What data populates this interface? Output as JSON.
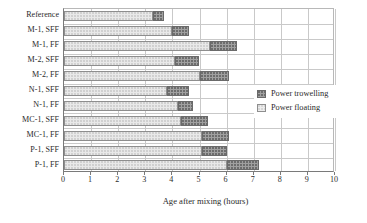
{
  "chart_data": {
    "type": "bar",
    "orientation": "horizontal",
    "stacked": true,
    "title": "",
    "xlabel": "Age after mixing (hours)",
    "ylabel": "",
    "xlim": [
      0,
      10
    ],
    "xticks": [
      "0",
      "1",
      "2",
      "3",
      "4",
      "5",
      "6",
      "7",
      "8",
      "9",
      "10"
    ],
    "grid": "vertical-and-horizontal",
    "legend_position": "right-middle",
    "categories": [
      "Reference",
      "M-1, SFF",
      "M-1, FF",
      "M-2, SFF",
      "M-2, FF",
      "N-1, SFF",
      "N-1, FF",
      "MC-1, SFF",
      "MC-1, FF",
      "P-1, SFF",
      "P-1, FF"
    ],
    "series": [
      {
        "name": "Power floating",
        "color": "#e9e9e9",
        "start": [
          0,
          0,
          0,
          0,
          0,
          0,
          0,
          0,
          0,
          0,
          0
        ],
        "values": [
          3.3,
          4.0,
          5.4,
          4.1,
          5.0,
          3.8,
          4.2,
          4.3,
          5.1,
          5.1,
          6.0
        ]
      },
      {
        "name": "Power trowelling",
        "color": "#a0a0a0",
        "start": [
          3.3,
          4.0,
          5.4,
          4.1,
          5.0,
          3.8,
          4.2,
          4.3,
          5.1,
          5.1,
          6.0
        ],
        "values": [
          0.4,
          0.6,
          1.0,
          0.9,
          1.1,
          0.8,
          0.55,
          1.0,
          1.0,
          0.9,
          1.2
        ],
        "end": [
          3.7,
          4.6,
          6.4,
          5.0,
          6.1,
          4.6,
          4.75,
          5.3,
          6.1,
          6.0,
          7.2
        ]
      }
    ]
  },
  "legend": {
    "entries": [
      {
        "label": "Power trowelling",
        "swatch": "trowel"
      },
      {
        "label": "Power floating",
        "swatch": "float"
      }
    ]
  }
}
